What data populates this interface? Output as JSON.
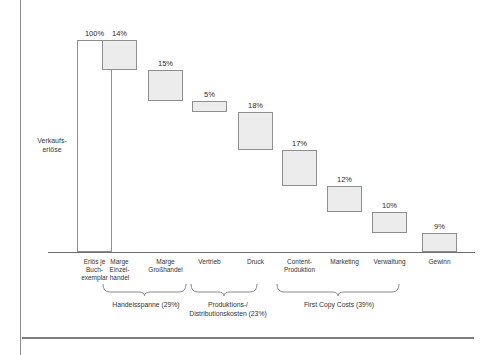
{
  "chart_data": {
    "type": "bar",
    "title": "",
    "subtitle": "",
    "xlabel": "",
    "ylabel": "Verkaufs-\nerlöse",
    "ylim": [
      0,
      100
    ],
    "grid": false,
    "legend": "none",
    "note": "Waterfall / cascade chart: first bar is the 100% baseline (Erlös je Buchexemplar), remaining bars are successive deductions stacked downward, ending with 9% profit (Gewinn).",
    "categories": [
      "Erlös je\nBuch-\nexemplar",
      "Marge\nEinzel-\nhandel",
      "Marge\nGroßhandel",
      "Vertrieb",
      "Druck",
      "Content-\nProduktion",
      "Marketing",
      "Verwaltung",
      "Gewinn"
    ],
    "values": [
      100,
      14,
      15,
      5,
      18,
      17,
      12,
      10,
      9
    ],
    "value_labels": [
      "100%",
      "14%",
      "15%",
      "5%",
      "18%",
      "17%",
      "12%",
      "10%",
      "9%"
    ],
    "cumulative_top": [
      100,
      100,
      86,
      71,
      66,
      48,
      31,
      19,
      9
    ],
    "groups": [
      {
        "label": "Handelsspanne (29%)",
        "value": 29,
        "members": [
          "Marge Einzelhandel",
          "Marge Großhandel"
        ]
      },
      {
        "label": "Produktions-/\nDistributionskosten (23%)",
        "value": 23,
        "members": [
          "Vertrieb",
          "Druck"
        ]
      },
      {
        "label": "First Copy Costs (39%)",
        "value": 39,
        "members": [
          "Content-Produktion",
          "Marketing",
          "Verwaltung"
        ]
      }
    ]
  },
  "colors": {
    "bar_fill": "#ececec",
    "bar_fill_baseline": "#ffffff",
    "bar_stroke": "#8e8e8e",
    "axis": "#6e6e6e",
    "frame": "#8a8a8a",
    "text": "#2b2b2b",
    "background": "#ffffff"
  }
}
